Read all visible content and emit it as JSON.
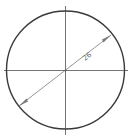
{
  "drawing": {
    "shape": "circle",
    "dimension": {
      "type": "diameter",
      "label": "26"
    },
    "colors": {
      "outline": "#3a3a3a",
      "dimension": "#7a7a7a",
      "background": "#ffffff"
    }
  }
}
